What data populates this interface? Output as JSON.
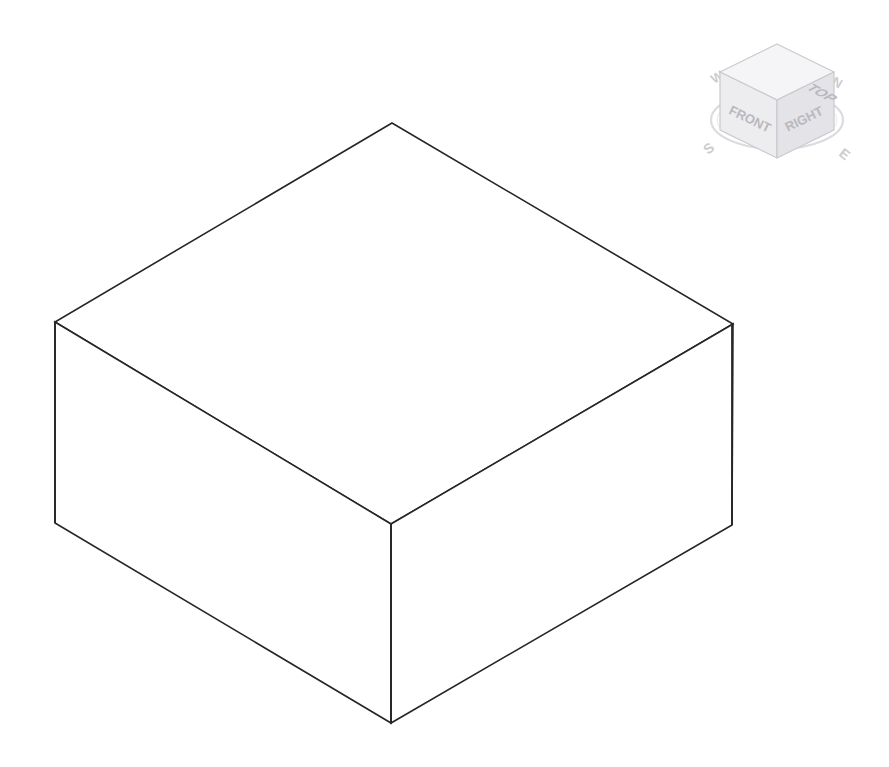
{
  "app": {
    "background_color": "#ffffff",
    "line_color": "#262626",
    "title": "3D Isometric Viewport"
  },
  "model": {
    "name": "rectangular-box",
    "shape": "box",
    "projection": "isometric",
    "edge_color": "#262626",
    "edge_width": 1.6,
    "face_fill": "#ffffff",
    "vertices": {
      "top_apex": [
        392,
        123
      ],
      "top_left": [
        55,
        322
      ],
      "top_right": [
        733,
        324
      ],
      "top_center_front": [
        391,
        524
      ],
      "bottom_left": [
        55,
        523
      ],
      "bottom_right": [
        732,
        525
      ],
      "bottom_front": [
        391,
        723
      ]
    },
    "faces": [
      {
        "name": "top-face",
        "points": "392,123 733,324 391,524 55,322"
      },
      {
        "name": "left-front-face",
        "points": "55,322 391,524 391,723 55,523"
      },
      {
        "name": "right-front-face",
        "points": "391,524 733,324 732,525 391,723"
      }
    ]
  },
  "viewcube": {
    "name": "view-cube",
    "faces": {
      "top": "TOP",
      "front": "FRONT",
      "right": "RIGHT"
    },
    "compass": {
      "north": "N",
      "south": "S",
      "east": "E",
      "west": "W"
    },
    "colors": {
      "face_top": "#f4f4f6",
      "face_front": "#ececef",
      "face_right": "#e4e4e8",
      "outline": "#c8c8cc",
      "ring": "#dadade",
      "label": "#b9b9bd",
      "compass_label": "#cccccf"
    }
  }
}
